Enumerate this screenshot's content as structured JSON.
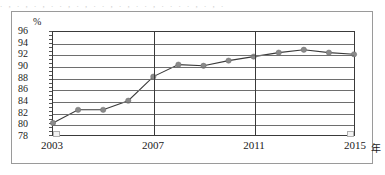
{
  "figure": {
    "top_text_sliver": ". , . , . , . . , . , . . , . , . . , . . . . , . , .",
    "y_unit_label": "%",
    "x_unit_label": "年"
  },
  "chart_data": {
    "type": "line",
    "title": "",
    "subtitle": "",
    "xlabel": "年",
    "ylabel": "%",
    "x": [
      2003,
      2004,
      2005,
      2006,
      2007,
      2008,
      2009,
      2010,
      2011,
      2012,
      2013,
      2014,
      2015
    ],
    "categories": [
      "2003",
      "2004",
      "2005",
      "2006",
      "2007",
      "2008",
      "2009",
      "2010",
      "2011",
      "2012",
      "2013",
      "2014",
      "2015"
    ],
    "values": [
      80.1,
      82.4,
      82.4,
      84.0,
      88.2,
      90.3,
      90.1,
      91.0,
      91.7,
      92.4,
      92.9,
      92.4,
      92.1
    ],
    "series": [
      {
        "name": "",
        "values": [
          80.1,
          82.4,
          82.4,
          84.0,
          88.2,
          90.3,
          90.1,
          91.0,
          91.7,
          92.4,
          92.9,
          92.4,
          92.1
        ]
      }
    ],
    "xlim": [
      2003,
      2015
    ],
    "ylim": [
      78,
      96
    ],
    "y_ticks": [
      78,
      80,
      82,
      84,
      86,
      88,
      90,
      92,
      94,
      96
    ],
    "y_tick_labels": [
      "78",
      "80",
      "82",
      "84",
      "86",
      "88",
      "90",
      "92",
      "94",
      "96"
    ],
    "x_ticks": [
      2003,
      2007,
      2011,
      2015
    ],
    "x_tick_labels": [
      "2003",
      "2007",
      "2011",
      "2015"
    ],
    "x_major_gridlines": [
      2003,
      2007,
      2011,
      2015
    ],
    "grid": true,
    "legend": false,
    "legend_position": "none",
    "marker": "circle",
    "colors": {
      "line": "#3a3a3a",
      "marker": "#8a8a8a",
      "grid": "#6e6e6e",
      "axis": "#3a3a3a",
      "frame": "#9a9a9a",
      "text": "#1a1a1a"
    }
  }
}
